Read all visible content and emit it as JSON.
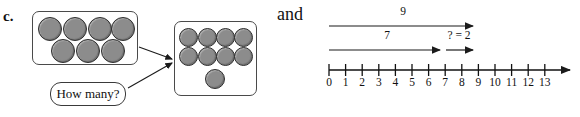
{
  "part_label": "c.",
  "conjunction": "and",
  "callout": {
    "text": "How many?"
  },
  "counter_sets": [
    {
      "name": "start-set",
      "count": 7,
      "rows": [
        4,
        3
      ],
      "color": "#8c8c8c",
      "outline": "#2e2e2e"
    },
    {
      "name": "result-set",
      "count": 9,
      "rows": [
        4,
        4,
        1
      ],
      "color": "#8c8c8c",
      "outline": "#2e2e2e"
    }
  ],
  "number_line": {
    "min": 0,
    "max": 13,
    "tick_labels": [
      "0",
      "1",
      "2",
      "3",
      "4",
      "5",
      "6",
      "7",
      "8",
      "9",
      "10",
      "11",
      "12",
      "13"
    ],
    "axis_color": "#111111",
    "jumps": [
      {
        "name": "total-jump",
        "label": "9",
        "from": 0,
        "to": 9
      },
      {
        "name": "known-part-jump",
        "label": "7",
        "from": 0,
        "to": 7
      },
      {
        "name": "unknown-part-jump",
        "label": "? = 2",
        "from": 7,
        "to": 9
      }
    ]
  }
}
